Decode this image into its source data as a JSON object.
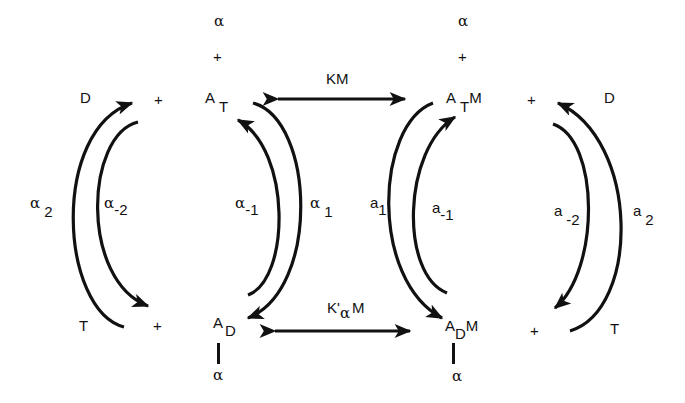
{
  "diagram": {
    "title": "",
    "colors": {
      "ink": "#111111",
      "background": "#ffffff"
    },
    "nodes": {
      "D_left": "D",
      "T_left": "T",
      "plus_left_top": "+",
      "plus_left_bottom": "+",
      "A_T": {
        "base": "A",
        "sub": "T"
      },
      "A_D": {
        "base": "A",
        "sub": "D"
      },
      "A_TM": {
        "base": "A",
        "sub": "T",
        "suffix": "M"
      },
      "A_DM": {
        "base": "A",
        "sub": "D",
        "suffix": "M"
      },
      "plus_right_top": "+",
      "plus_right_bottom": "+",
      "D_right": "D",
      "T_right": "T",
      "alpha_top_left": "α",
      "plus_top_left": "+",
      "alpha_top_right": "α",
      "plus_top_right": "+",
      "alpha_bottom_left": "α",
      "alpha_bottom_right": "α"
    },
    "rate_labels": {
      "alpha_2": {
        "base": "α",
        "sub": "2"
      },
      "alpha_minus_2": {
        "base": "α",
        "sub": "-2"
      },
      "alpha_minus_1": {
        "base": "α",
        "sub": "-1"
      },
      "alpha_1": {
        "base": "α",
        "sub": "1"
      },
      "a_1": {
        "base": "a",
        "sub": "1"
      },
      "a_minus_1": {
        "base": "a",
        "sub": "-1"
      },
      "a_minus_2": {
        "base": "a",
        "sub": "-2"
      },
      "a_2": {
        "base": "a",
        "sub": "2"
      }
    },
    "equilibrium_labels": {
      "top": "KM",
      "bottom": {
        "prefix": "K'",
        "sub": "α",
        "suffix": "M"
      }
    }
  }
}
